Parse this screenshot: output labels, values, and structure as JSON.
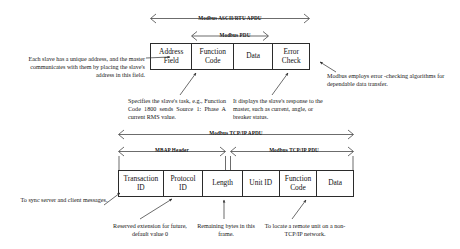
{
  "diagram": {
    "ascii_rtu": {
      "apdu_label": "Modbus ASCII/RTU APDU",
      "pdu_label": "Modbus PDU",
      "fields": [
        {
          "name": "address-field",
          "line1": "Address",
          "line2": "Field"
        },
        {
          "name": "function-code-field",
          "line1": "Function",
          "line2": "Code"
        },
        {
          "name": "data-field",
          "line1": "Data",
          "line2": ""
        },
        {
          "name": "error-check-field",
          "line1": "Error",
          "line2": "Check"
        }
      ],
      "notes": {
        "address": "Each slave has a unique address, and the master communicates with them by placing the slave's address in this field.",
        "error_check": "Modbus employs error -checking algorithms for dependable data transfer.",
        "function_code": "Specifies the slave's task, e.g., Function Code 1800 sends Source 1: Phase A current RMS value.",
        "data": "It displays the slave's response to the master, such as current, angle, or breaker status."
      }
    },
    "tcp_ip": {
      "apdu_label": "Modbus TCP/IP APDU",
      "mbap_label": "MBAP Header",
      "pdu_label": "Modbus TCP/IP PDU",
      "fields": [
        {
          "name": "transaction-id-field",
          "line1": "Transaction",
          "line2": "ID"
        },
        {
          "name": "protocol-id-field",
          "line1": "Protocol",
          "line2": "ID"
        },
        {
          "name": "length-field",
          "line1": "Length",
          "line2": ""
        },
        {
          "name": "unit-id-field",
          "line1": "Unit ID",
          "line2": ""
        },
        {
          "name": "function-code-field",
          "line1": "Function",
          "line2": "Code"
        },
        {
          "name": "data-field",
          "line1": "Data",
          "line2": ""
        }
      ],
      "notes": {
        "transaction_id": "To sync server and client messages.",
        "protocol_id": "Reserved extension for future, default value 0",
        "length": "Remaining bytes in this frame.",
        "unit_id": "To locate a remote unit on a non-TCP/IP network."
      }
    }
  }
}
